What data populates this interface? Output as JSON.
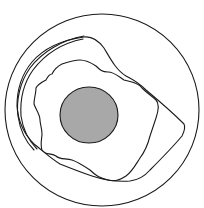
{
  "diagram": {
    "type": "concentric-contour-sketch",
    "background": "#ffffff",
    "stroke_color": "#1a1a1a",
    "core_fill": "#a8a8a8",
    "elements": [
      {
        "id": "outer-circle",
        "shape": "circle",
        "cx": 102,
        "cy": 110,
        "r": 97
      },
      {
        "id": "outer-contour",
        "shape": "irregular-closed-path"
      },
      {
        "id": "inner-contour",
        "shape": "irregular-closed-path"
      },
      {
        "id": "double-arc",
        "shape": "double-stroke-arc",
        "position": "upper-left"
      },
      {
        "id": "core",
        "shape": "filled-circle",
        "cx": 89,
        "cy": 115,
        "r": 29
      }
    ]
  }
}
